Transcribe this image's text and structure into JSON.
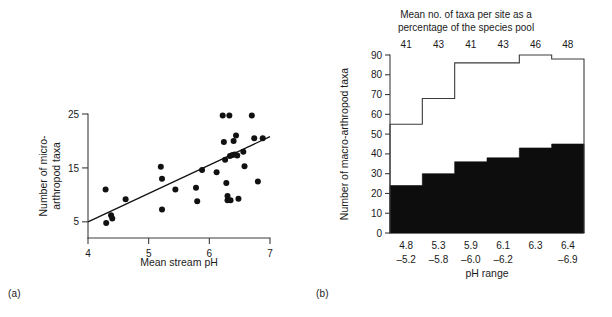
{
  "figure": {
    "panel_a_label": "(a)",
    "panel_b_label": "(b)"
  },
  "chart_data": [
    {
      "type": "scatter",
      "panel": "(a)",
      "title": "",
      "xlabel": "Mean stream pH",
      "ylabel": "Number of micro-arthropod taxa",
      "ylabel_line1": "Number of micro-",
      "ylabel_line2": "arthropod taxa",
      "xlim": [
        4,
        7
      ],
      "ylim": [
        2,
        25
      ],
      "xticks": [
        4,
        5,
        6,
        7
      ],
      "xticklabels": [
        "4",
        "5",
        "6",
        "7"
      ],
      "yticks": [
        5,
        15,
        25
      ],
      "yticklabels": [
        "5",
        "15",
        "25"
      ],
      "grid": false,
      "legend": "none",
      "points": [
        [
          4.29,
          11.0
        ],
        [
          4.3,
          4.8
        ],
        [
          4.38,
          6.2
        ],
        [
          4.4,
          5.6
        ],
        [
          4.62,
          9.2
        ],
        [
          5.2,
          15.2
        ],
        [
          5.22,
          13.0
        ],
        [
          5.22,
          7.3
        ],
        [
          5.44,
          11.0
        ],
        [
          5.78,
          11.3
        ],
        [
          5.8,
          8.8
        ],
        [
          5.88,
          14.6
        ],
        [
          6.12,
          14.2
        ],
        [
          6.22,
          24.7
        ],
        [
          6.24,
          19.8
        ],
        [
          6.26,
          16.5
        ],
        [
          6.28,
          12.2
        ],
        [
          6.3,
          9.8
        ],
        [
          6.3,
          9.0
        ],
        [
          6.33,
          24.7
        ],
        [
          6.34,
          17.2
        ],
        [
          6.35,
          9.0
        ],
        [
          6.38,
          17.4
        ],
        [
          6.4,
          20.0
        ],
        [
          6.42,
          17.5
        ],
        [
          6.44,
          21.0
        ],
        [
          6.46,
          17.3
        ],
        [
          6.48,
          9.3
        ],
        [
          6.56,
          18.0
        ],
        [
          6.58,
          15.3
        ],
        [
          6.7,
          24.7
        ],
        [
          6.74,
          20.5
        ],
        [
          6.8,
          12.5
        ],
        [
          6.88,
          20.5
        ]
      ],
      "trendline": {
        "x": [
          4.0,
          7.0
        ],
        "y": [
          5.0,
          20.8
        ]
      }
    },
    {
      "type": "bar",
      "panel": "(b)",
      "title": "Mean no. of taxa per site as a percentage of the species pool",
      "title_line1": "Mean no. of taxa per site as a",
      "title_line2": "percentage of the species pool",
      "xlabel": "pH range",
      "ylabel": "Number of macro-arthropod taxa",
      "ylim": [
        0,
        90
      ],
      "yticks": [
        0,
        10,
        20,
        30,
        40,
        50,
        60,
        70,
        80,
        90
      ],
      "yticklabels": [
        "0",
        "10",
        "20",
        "30",
        "40",
        "50",
        "60",
        "70",
        "80",
        "90"
      ],
      "grid": false,
      "legend": "none",
      "categories": [
        "4.8 -5.2",
        "5.3 -5.8",
        "5.9 -6.0",
        "6.1 -6.2",
        "6.3",
        "6.4 -6.9"
      ],
      "category_labels": [
        {
          "line1": "4.8",
          "line2": "–5.2"
        },
        {
          "line1": "5.3",
          "line2": "–5.8"
        },
        {
          "line1": "5.9",
          "line2": "–6.0"
        },
        {
          "line1": "6.1",
          "line2": "–6.2"
        },
        {
          "line1": "6.3",
          "line2": ""
        },
        {
          "line1": "6.4",
          "line2": "–6.9"
        }
      ],
      "top_annotations": [
        "41",
        "43",
        "41",
        "43",
        "46",
        "48"
      ],
      "top_annotation_label": "Mean no. of taxa per site as a percentage of the species pool",
      "series": [
        {
          "name": "species pool (total taxa)",
          "values": [
            55,
            68,
            86,
            86,
            90,
            88
          ],
          "style": "outline"
        },
        {
          "name": "mean no. of taxa per site",
          "values": [
            24,
            30,
            36,
            38,
            43,
            45
          ],
          "style": "filled"
        }
      ]
    }
  ]
}
